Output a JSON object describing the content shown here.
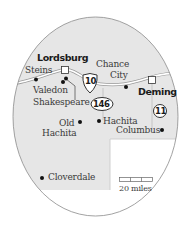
{
  "map": {
    "colors": {
      "land_us": "#e6e6e6",
      "land_other": "#ffffff",
      "outline": "#8a8a8a",
      "road": "#ffffff",
      "road_edge": "#9a9a9a",
      "town_dot": "#111111"
    },
    "major_cities": [
      {
        "name": "Lordsburg",
        "marker": "square"
      },
      {
        "name": "Deming",
        "marker": "square"
      }
    ],
    "towns": [
      {
        "name": "Steins"
      },
      {
        "name": "Valedon"
      },
      {
        "name": "Shakespeare"
      },
      {
        "name": "Chance City",
        "line1": "Chance",
        "line2": "City"
      },
      {
        "name": "Old Hachita",
        "line1": "Old",
        "line2": "Hachita"
      },
      {
        "name": "Hachita"
      },
      {
        "name": "Columbus"
      },
      {
        "name": "Cloverdale"
      }
    ],
    "highways": [
      {
        "number": "10",
        "type": "interstate-shield"
      },
      {
        "number": "146",
        "type": "state-oval"
      },
      {
        "number": "11",
        "type": "state-circle"
      }
    ],
    "scale": {
      "label": "20 miles"
    }
  }
}
